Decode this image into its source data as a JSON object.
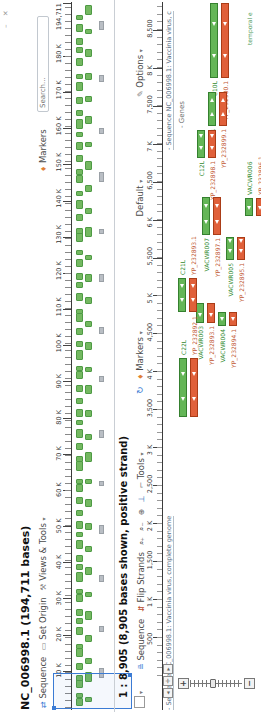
{
  "app": {
    "title": "NC_006998.1 (194,711 bases)",
    "window_glyphs": "– ✕"
  },
  "toolbar1": {
    "items": [
      {
        "label": "Sequence",
        "icon": "sequence-icon"
      },
      {
        "label": "Set Origin",
        "icon": "set-origin-icon"
      },
      {
        "label": "Views & Tools",
        "icon": "views-tools-icon",
        "caret": "▾"
      }
    ],
    "markers_label": "Markers",
    "search_placeholder": "Search..."
  },
  "overview": {
    "total_bases": 194711,
    "end_label": "194,711",
    "ruler_labels": [
      {
        "base": 10000,
        "label": "10 K"
      },
      {
        "base": 20000,
        "label": "20 K"
      },
      {
        "base": 30000,
        "label": "30 K"
      },
      {
        "base": 40000,
        "label": "40 K"
      },
      {
        "base": 50000,
        "label": "50 K"
      },
      {
        "base": 60000,
        "label": "60 K"
      },
      {
        "base": 70000,
        "label": "70 K"
      },
      {
        "base": 80000,
        "label": "80 K"
      },
      {
        "base": 90000,
        "label": "90 K"
      },
      {
        "base": 100000,
        "label": "100 K"
      },
      {
        "base": 110000,
        "label": "110 K"
      },
      {
        "base": 120000,
        "label": "120 K"
      },
      {
        "base": 130000,
        "label": "130 K"
      },
      {
        "base": 140000,
        "label": "140 K"
      },
      {
        "base": 150000,
        "label": "150 K"
      },
      {
        "base": 160000,
        "label": "160 K"
      },
      {
        "base": 170000,
        "label": "170 K"
      },
      {
        "base": 180000,
        "label": "180 K"
      }
    ],
    "density_rows": [
      {
        "y": 76,
        "color": "green",
        "xs": [
          6,
          14,
          24,
          31,
          42,
          55,
          63,
          77,
          88,
          96,
          110,
          118,
          130,
          142,
          150,
          163,
          175,
          183,
          196,
          208,
          220,
          228,
          241,
          250,
          262,
          274,
          287,
          295,
          308,
          320,
          333,
          341,
          352,
          365,
          377,
          390,
          398,
          411,
          424,
          432,
          445,
          457,
          470,
          478,
          491,
          503,
          516,
          529,
          537,
          550,
          562,
          575,
          583,
          596,
          608,
          621,
          633,
          646,
          659,
          667,
          680,
          692
        ]
      },
      {
        "y": 85,
        "color": "green",
        "xs": [
          10,
          30,
          48,
          70,
          92,
          115,
          137,
          160,
          182,
          205,
          228,
          250,
          272,
          295,
          318,
          340,
          362,
          385,
          408,
          430,
          452,
          475,
          498,
          520,
          542,
          565,
          588,
          610,
          632,
          655,
          678,
          697
        ]
      },
      {
        "y": 99,
        "color": "gray",
        "xs": [
          34,
          80,
          130,
          178,
          226,
          274,
          330,
          378,
          430,
          478,
          530,
          578,
          630,
          682
        ]
      }
    ],
    "widths_pattern": [
      6,
      3,
      8,
      4,
      5,
      7,
      3,
      6,
      4,
      5
    ]
  },
  "selection": {
    "x": 3,
    "y": 53,
    "w": 34,
    "h": 77
  },
  "detail": {
    "header": "1 : 8,905 (8,905 bases shown, positive strand)",
    "bases_shown": 8905,
    "toolbar": {
      "checkbox_caret": "▾",
      "items": [
        {
          "label": "Sequence",
          "icon": "sequence-icon"
        },
        {
          "label": "Flip Strands",
          "icon": "flip-strands-icon"
        }
      ],
      "icon_group": [
        "zoom-in-icon",
        "zoom-out-icon",
        "zoom-seq-icon",
        "pan-icon"
      ],
      "tools_label": "Tools",
      "right": [
        {
          "label": "Markers",
          "icon": "marker-pin-icon",
          "caret": "▾"
        },
        {
          "label": "Default",
          "caret": "▾"
        },
        {
          "label": "Options",
          "icon": "pencil-icon",
          "caret": "▾"
        }
      ]
    },
    "ruler_labels": [
      {
        "base": 500,
        "label": "500"
      },
      {
        "base": 1000,
        "label": "1 K"
      },
      {
        "base": 1500,
        "label": "1,500"
      },
      {
        "base": 2000,
        "label": "2 K"
      },
      {
        "base": 2500,
        "label": "2,500"
      },
      {
        "base": 3000,
        "label": "3 K"
      },
      {
        "base": 3500,
        "label": "3,500"
      },
      {
        "base": 4000,
        "label": "4 K"
      },
      {
        "base": 4500,
        "label": "4,500"
      },
      {
        "base": 5000,
        "label": "5 K"
      },
      {
        "base": 5500,
        "label": "5,500"
      },
      {
        "base": 6000,
        "label": "6 K"
      },
      {
        "base": 6500,
        "label": "6,500"
      },
      {
        "base": 7000,
        "label": "7 K"
      },
      {
        "base": 7500,
        "label": "7,500"
      },
      {
        "base": 8000,
        "label": "8 K"
      },
      {
        "base": 8500,
        "label": "8,500"
      }
    ],
    "caption_left": "- Sequence NC_006998.1: Vaccinia virus, complete genome",
    "caption_right": "- Sequence NC_006998.1: Vaccinia virus, c",
    "track_title": "- Genes",
    "temporal_label": "temporal e",
    "genes": [
      {
        "name": "C10L",
        "protein": "YP_232900.1",
        "x0": 634,
        "x1": 709,
        "row": 210,
        "strand": "minus",
        "label_side": "left"
      },
      {
        "name": "C11R",
        "protein": "YP_232899.1",
        "x0": 586,
        "x1": 620,
        "row": 208,
        "strand": "plus",
        "label_side": "left"
      },
      {
        "name": "C12L",
        "protein": "YP_232898.1",
        "x0": 554,
        "x1": 582,
        "row": 197,
        "strand": "minus",
        "label_side": "left"
      },
      {
        "name": "VACWR007",
        "protein": "YP_232897.1",
        "x0": 477,
        "x1": 515,
        "row": 202,
        "strand": "minus",
        "label_side": "left"
      },
      {
        "name": "VACWR006",
        "protein": "YP_232896.1",
        "x0": 496,
        "x1": 514,
        "row": 245,
        "strand": "minus",
        "label_side": "right"
      },
      {
        "name": "VACWR005",
        "protein": "YP_232895.1",
        "x0": 452,
        "x1": 475,
        "row": 226,
        "strand": "minus",
        "label_side": "left"
      },
      {
        "name": "VACWR004",
        "protein": "YP_232894.1",
        "x0": 386,
        "x1": 400,
        "row": 218,
        "strand": "minus",
        "label_side": "left"
      },
      {
        "name": "VACWR003",
        "protein": "YP_232893.1",
        "x0": 389,
        "x1": 409,
        "row": 196,
        "strand": "minus",
        "label_side": "left"
      },
      {
        "name": "C21L",
        "protein": "YP_232893.1",
        "x0": 400,
        "x1": 434,
        "row": 178,
        "strand": "minus",
        "label_side": "right"
      },
      {
        "name": "C22L",
        "protein": "YP_232892.1",
        "x0": 295,
        "x1": 354,
        "row": 179,
        "strand": "minus",
        "label_side": "right"
      }
    ]
  },
  "colors": {
    "gene_green": "#64b657",
    "cds_red": "#e0603a",
    "selection_blue": "#3b7bd4",
    "accent_orange": "#e07f35"
  }
}
